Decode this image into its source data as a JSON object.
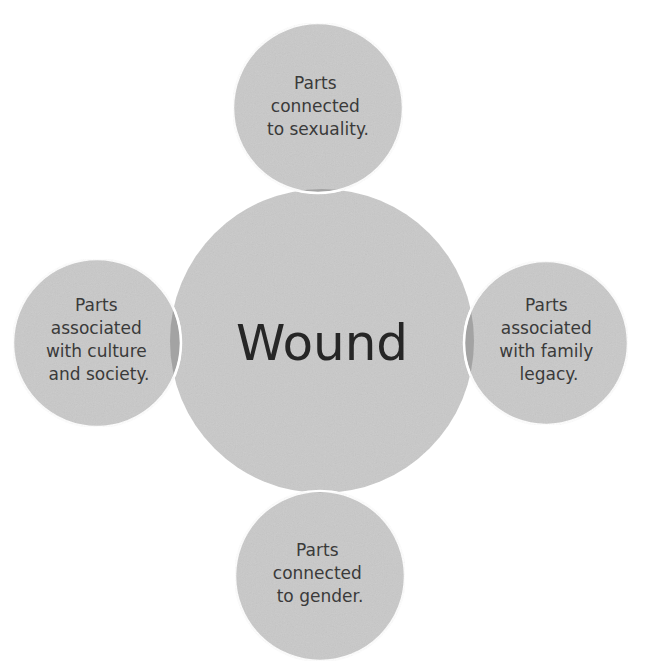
{
  "diagram": {
    "type": "radial-venn",
    "colors": {
      "fill": "#c9c9c9",
      "overlap": "#a3a3a3",
      "outline": "#ffffff",
      "text": "#3a3a3a",
      "center_text": "#262626"
    },
    "center": {
      "label": "Wound"
    },
    "satellites": [
      {
        "position": "top",
        "lines": [
          "Parts",
          "connected",
          "to sexuality."
        ]
      },
      {
        "position": "right",
        "lines": [
          "Parts",
          "associated",
          "with family",
          "legacy."
        ]
      },
      {
        "position": "bottom",
        "lines": [
          "Parts",
          "connected",
          "to gender."
        ]
      },
      {
        "position": "left",
        "lines": [
          "Parts",
          "associated",
          "with culture",
          "and society."
        ]
      }
    ]
  }
}
